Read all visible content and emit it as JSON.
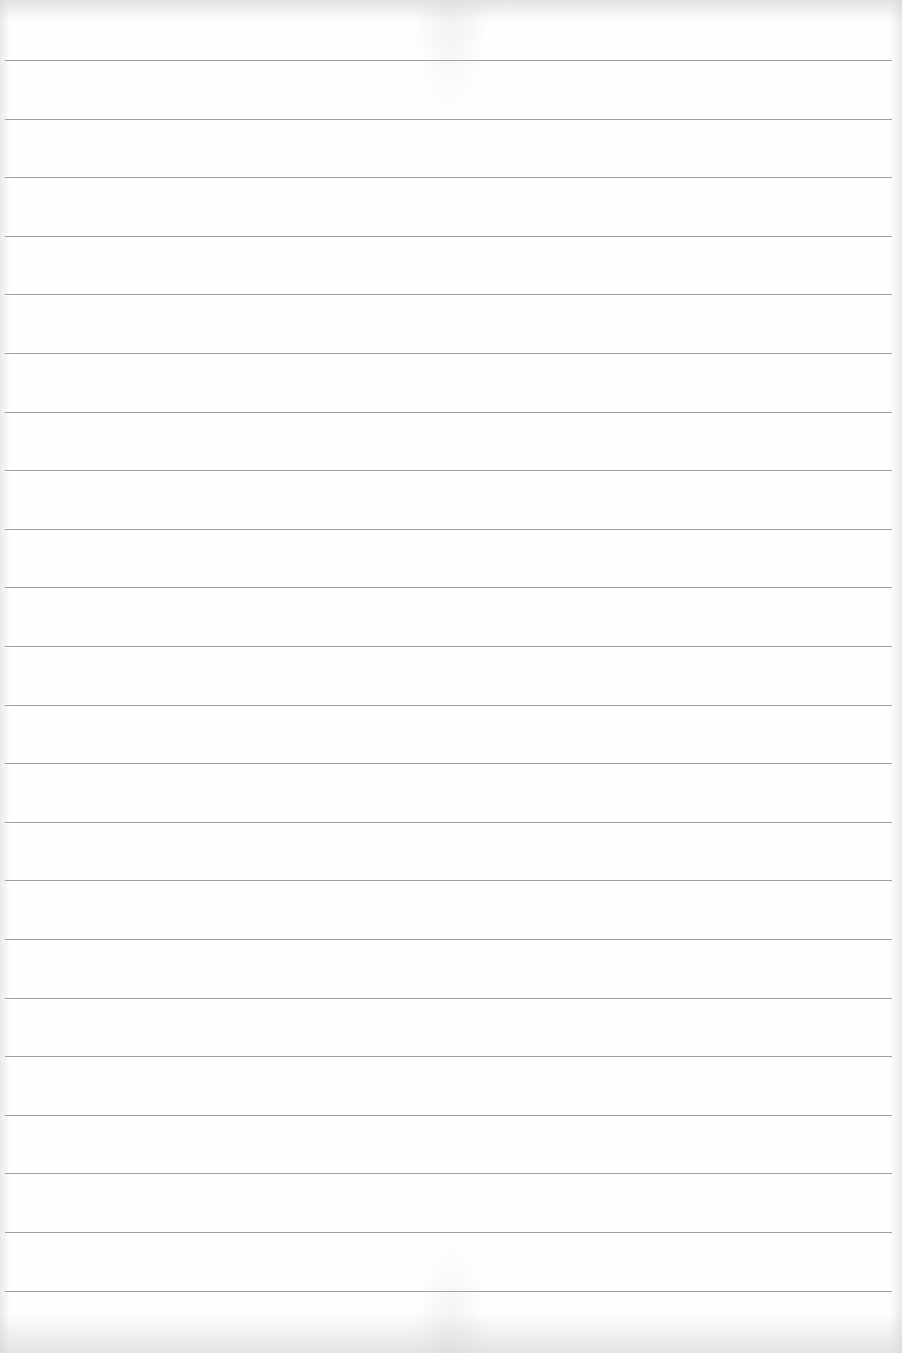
{
  "page": {
    "type": "lined-paper",
    "background_color": "#fefefe",
    "rule_color": "#8f8f8f",
    "rule_count": 22,
    "first_rule_y": 60,
    "rule_spacing": 58.6,
    "text": ""
  }
}
